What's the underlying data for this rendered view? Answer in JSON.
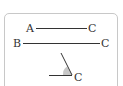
{
  "figure": {
    "row1": {
      "left_label": "A",
      "right_label": "C"
    },
    "row2": {
      "left_label": "B",
      "right_label": "C"
    },
    "angle": {
      "vertex_label": "C",
      "shade_color": "#c8c8c8"
    },
    "line_color": "#333333",
    "frame_color": "#c8c8c8"
  }
}
